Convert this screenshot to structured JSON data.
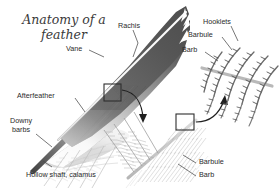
{
  "figure": {
    "title": "Anatomy of a\nfeather",
    "background_color": "#ffffff",
    "text_color": "#2b2b2b",
    "feather_dark_color": "#585858",
    "feather_light_color": "#d8d8d8",
    "rachis_color": "#f2f2f2",
    "detail_line_color": "#6e6e6e",
    "box_color": "#333333"
  },
  "labels": {
    "rachis": "Rachis",
    "vane": "Vane",
    "afterfeather": "Afterfeather",
    "downy_barbs": "Downy\nbarbs",
    "downy_barbs_line1": "Downy",
    "downy_barbs_line2": "barbs",
    "hollow_shaft": "Hollow shaft, calamus",
    "hooklets": "Hooklets",
    "barbule_top": "Barbule",
    "barb_top": "Barb",
    "barbule_bottom": "Barbule",
    "barb_bottom": "Barb"
  },
  "diagram": {
    "main_feather_name": "whole-feather-illustration",
    "barb_detail_name": "barb-magnification-illustration",
    "barbule_detail_name": "barbule-hooklet-magnification-illustration",
    "callout_box_1": "magnify-box-on-vane",
    "callout_box_2": "magnify-box-on-barb",
    "callout_arrow_1": "arrow-vane-to-barb-detail",
    "callout_arrow_2": "arrow-barb-to-barbule-detail"
  }
}
